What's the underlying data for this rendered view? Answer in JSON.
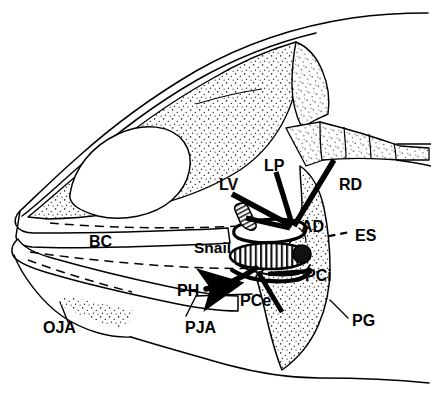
{
  "figure": {
    "background_color": "#ffffff",
    "line_color": "#000000",
    "stipple_color": "#3a3a3a",
    "width": 431,
    "height": 407
  },
  "labels": [
    {
      "id": "LP",
      "text": "LP",
      "x": 264,
      "y": 158,
      "role": "muscle-levator-posterior"
    },
    {
      "id": "LV",
      "text": "LV",
      "x": 219,
      "y": 177,
      "role": "muscle-levator-externus"
    },
    {
      "id": "RD",
      "text": "RD",
      "x": 339,
      "y": 177,
      "role": "muscle-retractor-dorsalis"
    },
    {
      "id": "AD",
      "text": "AD",
      "x": 301,
      "y": 219,
      "role": "muscle-adductor"
    },
    {
      "id": "ES",
      "text": "ES",
      "x": 355,
      "y": 228,
      "role": "esophagus"
    },
    {
      "id": "BC",
      "text": "BC",
      "x": 89,
      "y": 234,
      "role": "buccal-cavity"
    },
    {
      "id": "Snail",
      "text": "Snail",
      "x": 194,
      "y": 240,
      "role": "prey-item-snail"
    },
    {
      "id": "PCi",
      "text": "PCi",
      "x": 305,
      "y": 268,
      "role": "muscle-pharyngocleithralis-internus"
    },
    {
      "id": "PCe",
      "text": "PCe",
      "x": 240,
      "y": 293,
      "role": "muscle-pharyngocleithralis-externus"
    },
    {
      "id": "PH",
      "text": "PH",
      "x": 177,
      "y": 283,
      "role": "muscle-pharyngohyoideus"
    },
    {
      "id": "OJA",
      "text": "OJA",
      "x": 43,
      "y": 320,
      "role": "oral-jaw-apparatus"
    },
    {
      "id": "PJA",
      "text": "PJA",
      "x": 185,
      "y": 320,
      "role": "pharyngeal-jaw-apparatus"
    },
    {
      "id": "PG",
      "text": "PG",
      "x": 352,
      "y": 313,
      "role": "pectoral-girdle"
    }
  ]
}
